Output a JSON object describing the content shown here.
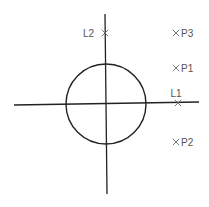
{
  "diagram": {
    "type": "geometry",
    "background": "#ffffff",
    "stroke_color": "#222222",
    "label_color": "#555555",
    "axes": {
      "horizontal": {
        "x1": 14,
        "y1": 105,
        "x2": 199,
        "y2": 102
      },
      "vertical": {
        "x1": 105,
        "y1": 14,
        "x2": 107,
        "y2": 194
      }
    },
    "circle": {
      "cx": 106,
      "cy": 104,
      "r": 40
    },
    "points": [
      {
        "id": "L1",
        "label": "L1",
        "x": 178,
        "y": 103,
        "label_position": "above"
      },
      {
        "id": "L2",
        "label": "L2",
        "x": 105,
        "y": 33,
        "label_position": "left"
      },
      {
        "id": "P1",
        "label": "P1",
        "x": 176,
        "y": 68,
        "label_position": "right"
      },
      {
        "id": "P2",
        "label": "P2",
        "x": 176,
        "y": 142,
        "label_position": "right"
      },
      {
        "id": "P3",
        "label": "P3",
        "x": 176,
        "y": 33,
        "label_position": "right"
      }
    ]
  }
}
